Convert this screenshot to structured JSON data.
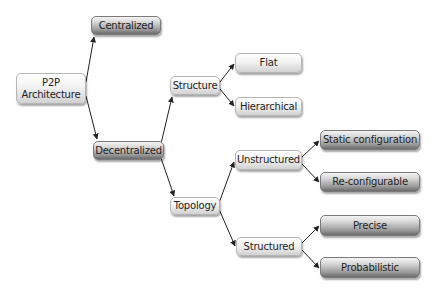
{
  "diagram": {
    "colors": {
      "background": "#ffffff",
      "edge": "#222222",
      "text": "#1e1e1e"
    },
    "nodes": {
      "p2p": {
        "label": "P2P Architecture",
        "line1": "P2P",
        "line2": "Architecture",
        "style": "light"
      },
      "centralized": {
        "label": "Centralized",
        "style": "dark"
      },
      "decentralized": {
        "label": "Decentralized",
        "style": "dark"
      },
      "structure": {
        "label": "Structure",
        "style": "light"
      },
      "topology": {
        "label": "Topology",
        "style": "light"
      },
      "flat": {
        "label": "Flat",
        "style": "light"
      },
      "hierarchical": {
        "label": "Hierarchical",
        "style": "light"
      },
      "unstructured": {
        "label": "Unstructured",
        "style": "light"
      },
      "structured": {
        "label": "Structured",
        "style": "light"
      },
      "static_configuration": {
        "label": "Static configuration",
        "style": "dark"
      },
      "reconfigurable": {
        "label": "Re-configurable",
        "style": "dark"
      },
      "precise": {
        "label": "Precise",
        "style": "dark"
      },
      "probabilistic": {
        "label": "Probabilistic",
        "style": "dark"
      }
    },
    "edges": [
      {
        "from": "p2p",
        "to": "centralized"
      },
      {
        "from": "p2p",
        "to": "decentralized"
      },
      {
        "from": "decentralized",
        "to": "structure"
      },
      {
        "from": "decentralized",
        "to": "topology"
      },
      {
        "from": "structure",
        "to": "flat"
      },
      {
        "from": "structure",
        "to": "hierarchical"
      },
      {
        "from": "topology",
        "to": "unstructured"
      },
      {
        "from": "topology",
        "to": "structured"
      },
      {
        "from": "unstructured",
        "to": "static_configuration"
      },
      {
        "from": "unstructured",
        "to": "reconfigurable"
      },
      {
        "from": "structured",
        "to": "precise"
      },
      {
        "from": "structured",
        "to": "probabilistic"
      }
    ]
  }
}
